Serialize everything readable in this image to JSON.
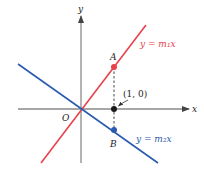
{
  "diagram": {
    "axes": {
      "x_label": "x",
      "y_label": "y",
      "origin_label": "O"
    },
    "lines": [
      {
        "name": "line-m1",
        "equation": "y = m₁x",
        "color": "#e8414a"
      },
      {
        "name": "line-m2",
        "equation": "y = m₂x",
        "color": "#2a5bb0"
      }
    ],
    "points": [
      {
        "label": "A",
        "color": "#e8414a"
      },
      {
        "label": "B",
        "color": "#2a5bb0"
      },
      {
        "label": "(1, 0)",
        "color": "#1a1a1a"
      }
    ],
    "colors": {
      "axis": "#8a8a8a",
      "dashed": "#333333",
      "text": "#222222"
    }
  }
}
